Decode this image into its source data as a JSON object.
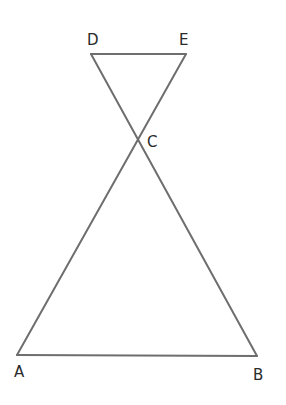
{
  "diagram": {
    "type": "geometry",
    "colors": {
      "line": "#6e6e6e",
      "label": "#2a2a2a",
      "background": "#ffffff"
    },
    "points": {
      "A": {
        "label": "A",
        "x": 17,
        "y": 355,
        "lx": 14,
        "ly": 377
      },
      "B": {
        "label": "B",
        "x": 257,
        "y": 356,
        "lx": 253,
        "ly": 380
      },
      "C": {
        "label": "C",
        "x": 138,
        "y": 143,
        "lx": 147,
        "ly": 147
      },
      "D": {
        "label": "D",
        "x": 91,
        "y": 54,
        "lx": 87,
        "ly": 45
      },
      "E": {
        "label": "E",
        "x": 186,
        "y": 54,
        "lx": 179,
        "ly": 45
      }
    },
    "segments": [
      {
        "from": "A",
        "to": "B"
      },
      {
        "from": "D",
        "to": "E"
      },
      {
        "from": "A",
        "to": "E"
      },
      {
        "from": "B",
        "to": "D"
      }
    ]
  }
}
